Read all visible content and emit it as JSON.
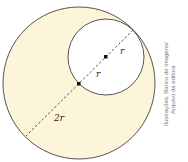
{
  "diagram": {
    "colors": {
      "fill": "#fdf5d9",
      "stroke": "#555555",
      "dash": "#555555",
      "dot": "#111111"
    },
    "big_circle": {
      "cx": 79,
      "cy": 83,
      "r": 76
    },
    "small_circle": {
      "cx": 106,
      "cy": 57,
      "r": 38
    },
    "labels": {
      "r_upper": "r",
      "r_lower": "r",
      "big_radius": "2r"
    },
    "credit_line1": "Ilustrações: Banco de imagens/",
    "credit_line2": "Arquivo da editora"
  }
}
